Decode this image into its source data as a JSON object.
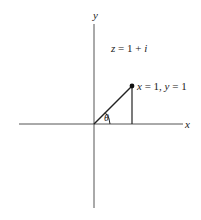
{
  "diagram": {
    "axis_labels": {
      "x": "x",
      "y": "y"
    },
    "equation": {
      "lhs": "z",
      "op": " = 1 + ",
      "i": "i"
    },
    "point_label": {
      "x": "x",
      "xv": " = 1, ",
      "y": "y",
      "yv": " = 1"
    },
    "angle_label": "θ",
    "colors": {
      "line": "#222222",
      "axis": "#555555",
      "background": "#ffffff"
    }
  }
}
